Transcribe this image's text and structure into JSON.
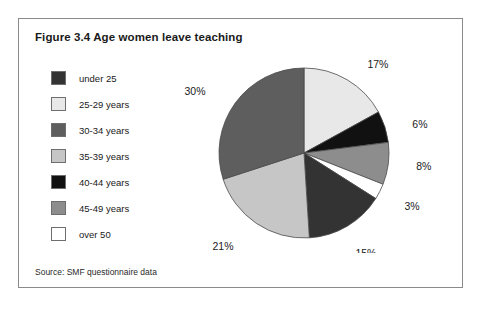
{
  "figure": {
    "title": "Figure 3.4 Age women leave teaching",
    "source": "Source: SMF questionnaire data"
  },
  "legend": {
    "items": [
      {
        "label": "under 25",
        "color": "#333333"
      },
      {
        "label": "25-29 years",
        "color": "#e8e8e8"
      },
      {
        "label": "30-34 years",
        "color": "#5e5e5e"
      },
      {
        "label": "35-39 years",
        "color": "#c6c6c6"
      },
      {
        "label": "40-44 years",
        "color": "#111111"
      },
      {
        "label": "45-49 years",
        "color": "#8d8d8d"
      },
      {
        "label": "over 50",
        "color": "#ffffff"
      }
    ]
  },
  "chart_data": {
    "type": "pie",
    "title": "Figure 3.4 Age women leave teaching",
    "categories": [
      "under 25",
      "25-29 years",
      "30-34 years",
      "35-39 years",
      "40-44 years",
      "45-49 years",
      "over 50"
    ],
    "values": [
      15,
      17,
      30,
      21,
      6,
      8,
      3
    ],
    "unit": "%",
    "labels": [
      "15%",
      "17%",
      "30%",
      "21%",
      "6%",
      "8%",
      "3%"
    ],
    "colors": [
      "#333333",
      "#e8e8e8",
      "#5e5e5e",
      "#c6c6c6",
      "#111111",
      "#8d8d8d",
      "#ffffff"
    ],
    "legend_position": "left",
    "grid": false,
    "start_angle_deg": 0,
    "direction": "clockwise",
    "draw_order": [
      "25-29 years",
      "40-44 years",
      "45-49 years",
      "over 50",
      "under 25",
      "35-39 years",
      "30-34 years"
    ],
    "geometry": {
      "cx": 130,
      "cy": 100,
      "r": 85
    },
    "label_offsets": {
      "17%": {
        "dx": 14,
        "dy": -4
      },
      "6%": {
        "dx": 16,
        "dy": 2
      },
      "8%": {
        "dx": 16,
        "dy": 2
      },
      "3%": {
        "dx": 14,
        "dy": 10
      },
      "15%": {
        "dx": 2,
        "dy": 18
      },
      "21%": {
        "dx": -16,
        "dy": 14
      },
      "30%": {
        "dx": -20,
        "dy": -4
      }
    }
  }
}
